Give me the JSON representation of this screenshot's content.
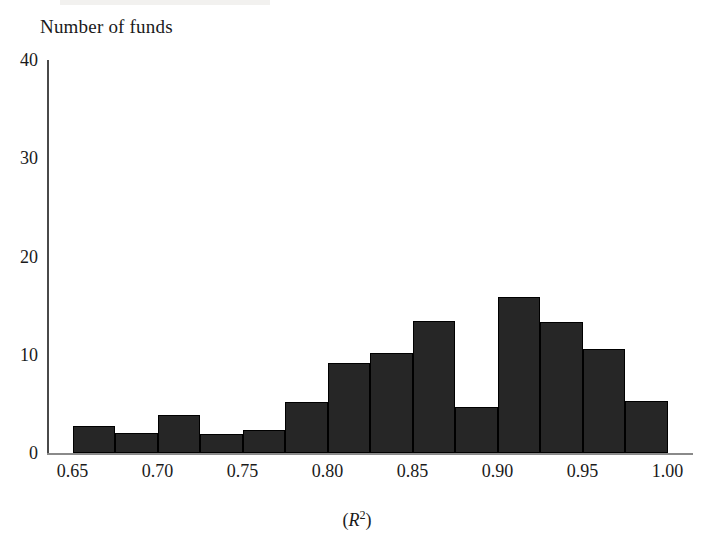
{
  "figure": {
    "y_axis_title": "Number of funds",
    "x_axis_title_prefix": "(",
    "x_axis_title_var": "R",
    "x_axis_title_sup": "2",
    "x_axis_title_suffix": ")",
    "bar_color": "#262626",
    "axis_color": "#4a4a4a",
    "background": "#ffffff"
  },
  "chart_data": {
    "type": "bar",
    "title": "",
    "subtitle": "",
    "xlabel": "(R2)",
    "ylabel": "Number of funds",
    "grid": false,
    "legend": null,
    "xlim": [
      0.635,
      1.015
    ],
    "ylim": [
      0,
      40
    ],
    "xticks": [
      0.65,
      0.7,
      0.75,
      0.8,
      0.85,
      0.9,
      0.95,
      1.0
    ],
    "xtick_labels": [
      "0.65",
      "0.70",
      "0.75",
      "0.80",
      "0.85",
      "0.90",
      "0.95",
      "1.00"
    ],
    "yticks": [
      0,
      10,
      20,
      30,
      40
    ],
    "ytick_labels": [
      "0",
      "10",
      "20",
      "30",
      "40"
    ],
    "bin_width": 0.025,
    "bin_edges": [
      0.65,
      0.675,
      0.7,
      0.725,
      0.75,
      0.775,
      0.8,
      0.825,
      0.85,
      0.875,
      0.9,
      0.925,
      0.95,
      0.975,
      1.0
    ],
    "categories": [
      "0.650-0.675",
      "0.675-0.700",
      "0.700-0.725",
      "0.725-0.750",
      "0.750-0.775",
      "0.775-0.800",
      "0.800-0.825",
      "0.825-0.850",
      "0.850-0.875",
      "0.875-0.900",
      "0.900-0.925",
      "0.925-0.950",
      "0.950-0.975",
      "0.975-1.000"
    ],
    "values": [
      2.8,
      2.0,
      3.9,
      1.9,
      2.3,
      5.2,
      9.2,
      10.2,
      13.4,
      4.7,
      15.9,
      13.3,
      10.6,
      5.3
    ],
    "bar_color": "#262626"
  }
}
